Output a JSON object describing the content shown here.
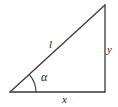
{
  "figure": {
    "name": "right-triangle-trigonometry-diagram",
    "background_color": "#ffffff",
    "stroke_color": "#3a3a3a",
    "label_color": "#1a1a1a",
    "labels": {
      "hypotenuse": "l",
      "vertical_leg": "y",
      "horizontal_leg": "x",
      "angle": "α"
    },
    "icons": {
      "angle_arc": "angle-arc-icon"
    },
    "geometry": {
      "vertex_bottom_left": [
        10,
        92
      ],
      "vertex_bottom_right": [
        105,
        92
      ],
      "vertex_top_right": [
        105,
        5
      ],
      "angle_arc_radius": 26,
      "stroke_width": 1.3
    }
  }
}
